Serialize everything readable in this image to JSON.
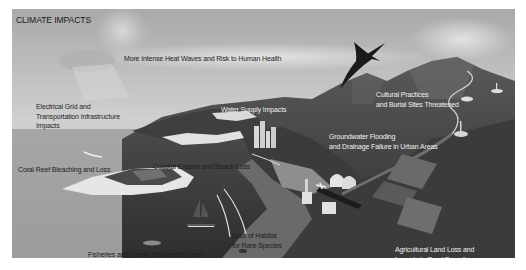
{
  "diagram": {
    "title": "CLIMATE IMPACTS",
    "labels": {
      "heat_waves": "More Intense Heat Waves and Risk to Human Health",
      "grid_line1": "Electrical Grid and",
      "grid_line2": "Transportation Infrastructure",
      "grid_line3": "Impacts",
      "water_supply": "Water Supply Impacts",
      "cultural_line1": "Cultural Practices",
      "cultural_line2": "and Burial Sites Threatened",
      "groundwater_line1": "Groundwater Flooding",
      "groundwater_line2": "and Drainage Failure in Urban Areas",
      "coral_reef": "Coral Reef Bleaching and Loss",
      "coastal_erosion": "Coastal Erosion and Beach Loss",
      "habitat_line1": "Loss of Habitat",
      "habitat_line2": "for Rare Species",
      "fisheries": "Fisheries and Ocean Biodiversity Loss",
      "agri_line1": "Agricultural Land Loss and",
      "agri_line2": "Impacts to Food Security"
    },
    "colors": {
      "sky": "#c4c4c4",
      "ocean": "#a3a3a3",
      "land_dark": "#3a3a3a",
      "land_mid": "#555555",
      "mountain": "#4a4a4a",
      "beach": "#dcdcdc"
    }
  }
}
